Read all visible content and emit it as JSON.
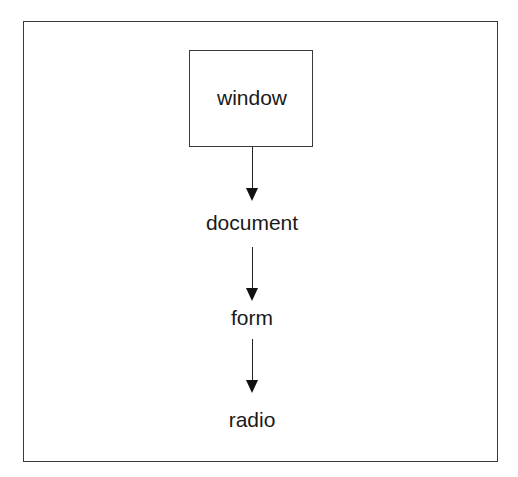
{
  "diagram": {
    "type": "hierarchy",
    "direction": "top-to-bottom",
    "nodes": [
      {
        "id": "window",
        "label": "window",
        "boxed": true
      },
      {
        "id": "document",
        "label": "document",
        "boxed": false
      },
      {
        "id": "form",
        "label": "form",
        "boxed": false
      },
      {
        "id": "radio",
        "label": "radio",
        "boxed": false
      }
    ],
    "edges": [
      {
        "from": "window",
        "to": "document"
      },
      {
        "from": "document",
        "to": "form"
      },
      {
        "from": "form",
        "to": "radio"
      }
    ],
    "colors": {
      "line": "#3a3a3a",
      "text": "#1a1a1a",
      "background": "#ffffff"
    }
  }
}
